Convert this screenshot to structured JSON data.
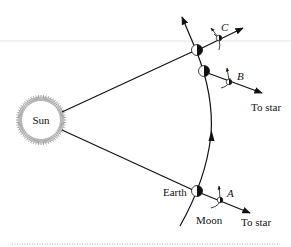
{
  "figure": {
    "sun": {
      "label": "Sun"
    },
    "earth_label": "Earth",
    "moon_label": "Moon",
    "positions": [
      {
        "id": "A",
        "label": "A",
        "star_label": "To star"
      },
      {
        "id": "B",
        "label": "B",
        "star_label": "To star"
      },
      {
        "id": "C",
        "label": "C"
      }
    ],
    "colors": {
      "line": "#111111",
      "ray": "#8a8a8a",
      "rule": "#dcdcdc",
      "dotted": "#9a9a9a"
    }
  }
}
